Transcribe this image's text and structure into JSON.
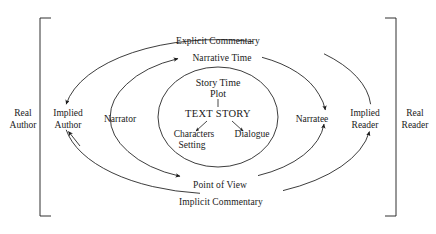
{
  "diagram": {
    "background": "#ffffff",
    "stroke": "#1a1a1a",
    "brackets": {
      "left": {
        "label": "Real\nAuthor",
        "line1": "Real",
        "line2": "Author"
      },
      "right": {
        "label": "Real\nReader",
        "line1": "Real",
        "line2": "Reader"
      }
    },
    "actors": {
      "implied_author": {
        "line1": "Implied",
        "line2": "Author"
      },
      "narrator": {
        "line1": "Narrator"
      },
      "narratee": {
        "line1": "Narratee"
      },
      "implied_reader": {
        "line1": "Implied",
        "line2": "Reader"
      }
    },
    "arcs": {
      "outer_top": "Explicit Commentary",
      "outer_bottom": "Implicit Commentary",
      "middle_top": "Narrative Time",
      "middle_bottom": "Point of View"
    },
    "core": {
      "story_time": "Story Time",
      "plot": "Plot",
      "text_story": "TEXT STORY",
      "characters": "Characters",
      "setting": "Setting",
      "dialogue": "Dialogue"
    }
  }
}
